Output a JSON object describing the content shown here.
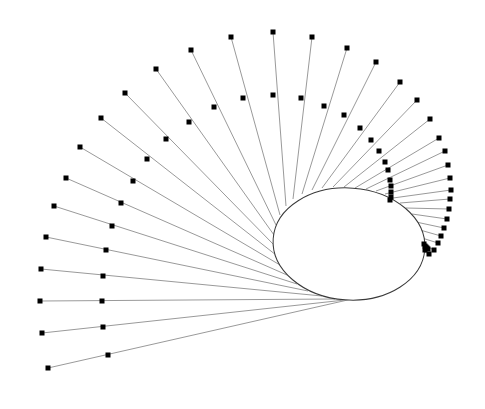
{
  "diagram": {
    "type": "tangent-line-fan",
    "background": "#ffffff",
    "ray_color": "#9a9a9a",
    "ellipse_color": "#3a3a3a",
    "marker_color": "#000000",
    "marker_size": 5,
    "ellipse": {
      "cx": 349,
      "cy": 244,
      "rx": 76,
      "ry": 56,
      "rotate": 4
    },
    "lines": [
      {
        "outer": [
          48,
          368
        ],
        "middle": [
          108,
          355
        ],
        "end": [
          352,
          299
        ]
      },
      {
        "outer": [
          42,
          333
        ],
        "middle": [
          103,
          327
        ],
        "end": [
          345,
          300
        ]
      },
      {
        "outer": [
          40,
          301
        ],
        "middle": [
          102,
          301
        ],
        "end": [
          335,
          299
        ]
      },
      {
        "outer": [
          41,
          269
        ],
        "middle": [
          103,
          276
        ],
        "end": [
          322,
          296
        ]
      },
      {
        "outer": [
          46,
          237
        ],
        "middle": [
          106,
          250
        ],
        "end": [
          308,
          291
        ]
      },
      {
        "outer": [
          54,
          206
        ],
        "middle": [
          112,
          226
        ],
        "end": [
          297,
          284
        ]
      },
      {
        "outer": [
          66,
          178
        ],
        "middle": [
          121,
          203
        ],
        "end": [
          287,
          275
        ]
      },
      {
        "outer": [
          80,
          147
        ],
        "middle": [
          133,
          181
        ],
        "end": [
          280,
          265
        ]
      },
      {
        "outer": [
          101,
          118
        ],
        "middle": [
          147,
          159
        ],
        "end": [
          276,
          255
        ]
      },
      {
        "outer": [
          125,
          93
        ],
        "middle": [
          166,
          139
        ],
        "end": [
          274,
          245
        ]
      },
      {
        "outer": [
          156,
          69
        ],
        "middle": [
          189,
          122
        ],
        "end": [
          274,
          235
        ]
      },
      {
        "outer": [
          191,
          50
        ],
        "middle": [
          214,
          107
        ],
        "end": [
          276,
          225
        ]
      },
      {
        "outer": [
          231,
          37
        ],
        "middle": [
          243,
          98
        ],
        "end": [
          280,
          215
        ]
      },
      {
        "outer": [
          273,
          32
        ],
        "middle": [
          273,
          95
        ],
        "end": [
          286,
          206
        ]
      },
      {
        "outer": [
          312,
          37
        ],
        "middle": [
          301,
          98
        ],
        "end": [
          293,
          199
        ]
      },
      {
        "outer": [
          347,
          48
        ],
        "middle": [
          324,
          106
        ],
        "end": [
          302,
          194
        ]
      },
      {
        "outer": [
          376,
          62
        ],
        "middle": [
          344,
          115
        ],
        "end": [
          312,
          190
        ]
      },
      {
        "outer": [
          400,
          82
        ],
        "middle": [
          360,
          128
        ],
        "end": [
          322,
          188
        ]
      },
      {
        "outer": [
          417,
          100
        ],
        "middle": [
          371,
          140
        ],
        "end": [
          333,
          187
        ]
      },
      {
        "outer": [
          430,
          119
        ],
        "middle": [
          379,
          151
        ],
        "end": [
          344,
          187
        ]
      },
      {
        "outer": [
          439,
          138
        ],
        "middle": [
          385,
          162
        ],
        "end": [
          355,
          188
        ]
      },
      {
        "outer": [
          445,
          151
        ],
        "middle": [
          388,
          170
        ],
        "end": [
          366,
          189
        ]
      },
      {
        "outer": [
          448,
          165
        ],
        "middle": [
          390,
          180
        ],
        "end": [
          376,
          191
        ]
      },
      {
        "outer": [
          450,
          178
        ],
        "middle": [
          391,
          186
        ],
        "end": [
          385,
          194
        ]
      },
      {
        "outer": [
          451,
          190
        ],
        "middle": [
          391,
          192
        ],
        "end": [
          393,
          198
        ]
      },
      {
        "outer": [
          450,
          199
        ],
        "middle": [
          391,
          197
        ],
        "end": [
          400,
          203
        ]
      },
      {
        "outer": [
          449,
          209
        ],
        "middle": [
          390,
          200
        ],
        "end": [
          406,
          208
        ]
      },
      {
        "outer": [
          447,
          219
        ],
        "middle": [
          424,
          244
        ],
        "end": [
          412,
          214
        ]
      },
      {
        "outer": [
          444,
          228
        ],
        "middle": [
          425,
          246
        ],
        "end": [
          416,
          222
        ]
      },
      {
        "outer": [
          441,
          236
        ],
        "middle": [
          426,
          247
        ],
        "end": [
          420,
          230
        ]
      },
      {
        "outer": [
          438,
          243
        ],
        "middle": [
          427,
          248
        ],
        "end": [
          422,
          238
        ]
      },
      {
        "outer": [
          434,
          250
        ],
        "middle": [
          428,
          249
        ],
        "end": [
          424,
          245
        ]
      },
      {
        "outer": [
          429,
          254
        ],
        "middle": [
          425,
          250
        ],
        "end": [
          425,
          252
        ]
      }
    ]
  }
}
